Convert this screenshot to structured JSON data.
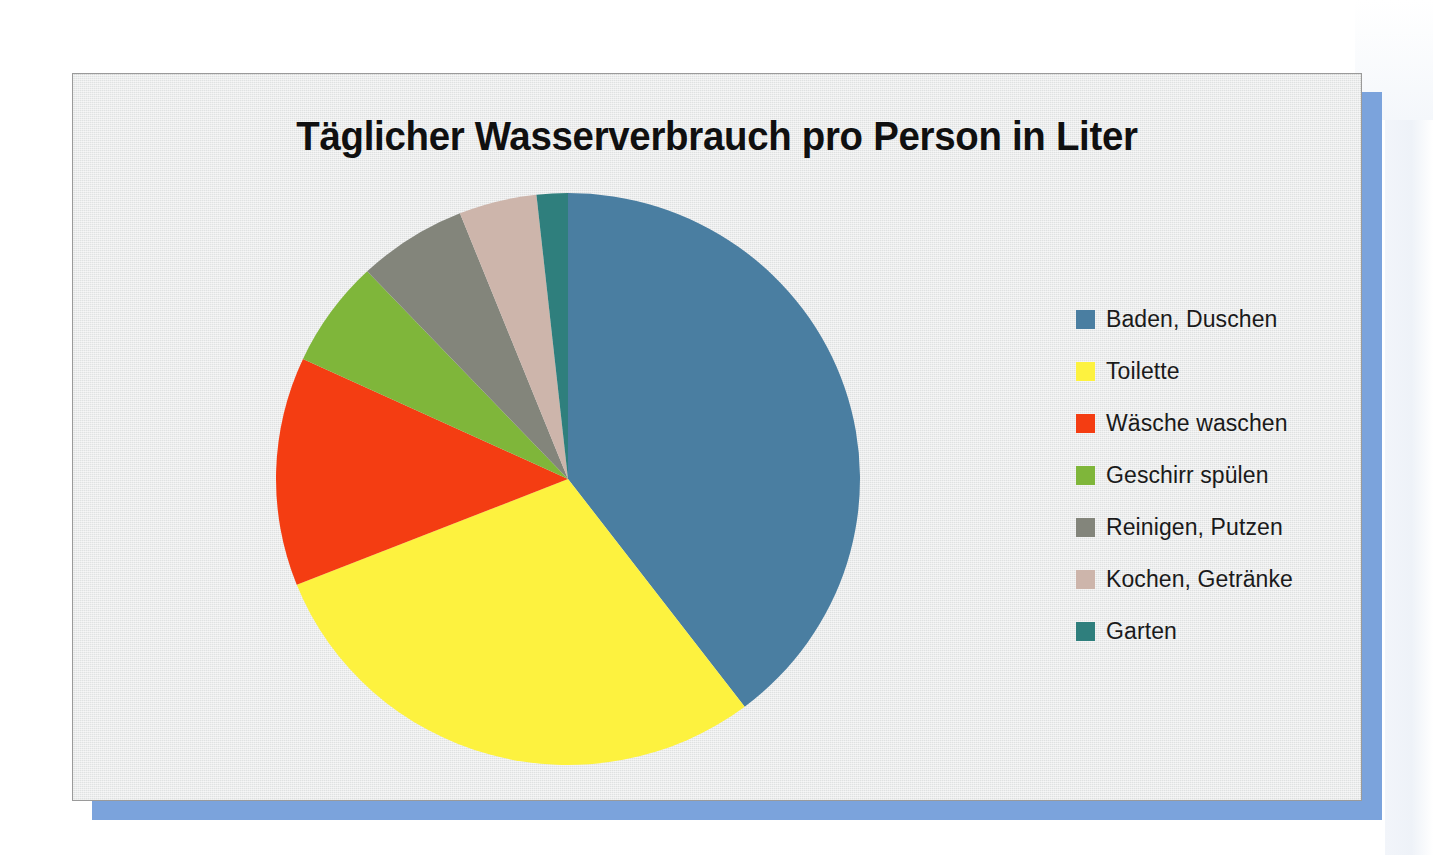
{
  "slide": {
    "title": "Täglicher Wasserverbrauch pro Person in Liter",
    "panel_background": "#e6e8e8",
    "shadow_color": "#7ba3dc"
  },
  "legend": {
    "position": "right",
    "items": [
      {
        "label": "Baden, Duschen",
        "color": "#4a7ea1"
      },
      {
        "label": "Toilette",
        "color": "#fdf23f"
      },
      {
        "label": "Wäsche waschen",
        "color": "#f43d12"
      },
      {
        "label": "Geschirr spülen",
        "color": "#7fb63a"
      },
      {
        "label": "Reinigen, Putzen",
        "color": "#83857b"
      },
      {
        "label": "Kochen, Getränke",
        "color": "#cdb5ab"
      },
      {
        "label": "Garten",
        "color": "#2f7f7d"
      }
    ]
  },
  "chart_data": {
    "type": "pie",
    "title": "Täglicher Wasserverbrauch pro Person in Liter",
    "xlabel": "",
    "ylabel": "",
    "unit": "Liter pro Person und Tag",
    "legend_position": "right",
    "grid": false,
    "start_angle_deg": 0,
    "direction": "clockwise",
    "categories": [
      "Baden, Duschen",
      "Toilette",
      "Wäsche waschen",
      "Geschirr spülen",
      "Reinigen, Putzen",
      "Kochen, Getränke",
      "Garten"
    ],
    "values": [
      46,
      34,
      15,
      7,
      7,
      5,
      2
    ],
    "percentages": [
      39.7,
      29.3,
      12.9,
      6.0,
      6.0,
      4.3,
      1.7
    ],
    "angles_deg": [
      142.9,
      105.6,
      46.6,
      21.8,
      21.8,
      15.5,
      6.2
    ],
    "colors": [
      "#4a7ea1",
      "#fdf23f",
      "#f43d12",
      "#7fb63a",
      "#83857b",
      "#cdb5ab",
      "#2f7f7d"
    ]
  }
}
